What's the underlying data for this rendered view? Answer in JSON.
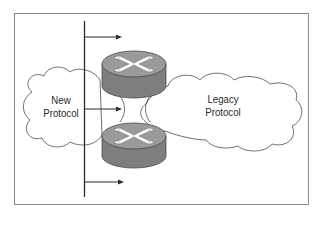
{
  "diagram": {
    "clouds": [
      {
        "id": "new",
        "label_line1": "New",
        "label_line2": "Protocol"
      },
      {
        "id": "legacy",
        "label_line1": "Legacy",
        "label_line2": "Protocol"
      }
    ],
    "routers": [
      {
        "id": "router-top",
        "icon": "router-icon"
      },
      {
        "id": "router-bottom",
        "icon": "router-icon"
      }
    ],
    "arrows": 3,
    "colors": {
      "router_top": "#9a9a9a",
      "router_side": "#7e7e7e",
      "line": "#2a2a2a",
      "frame": "#8a8a8a"
    }
  }
}
